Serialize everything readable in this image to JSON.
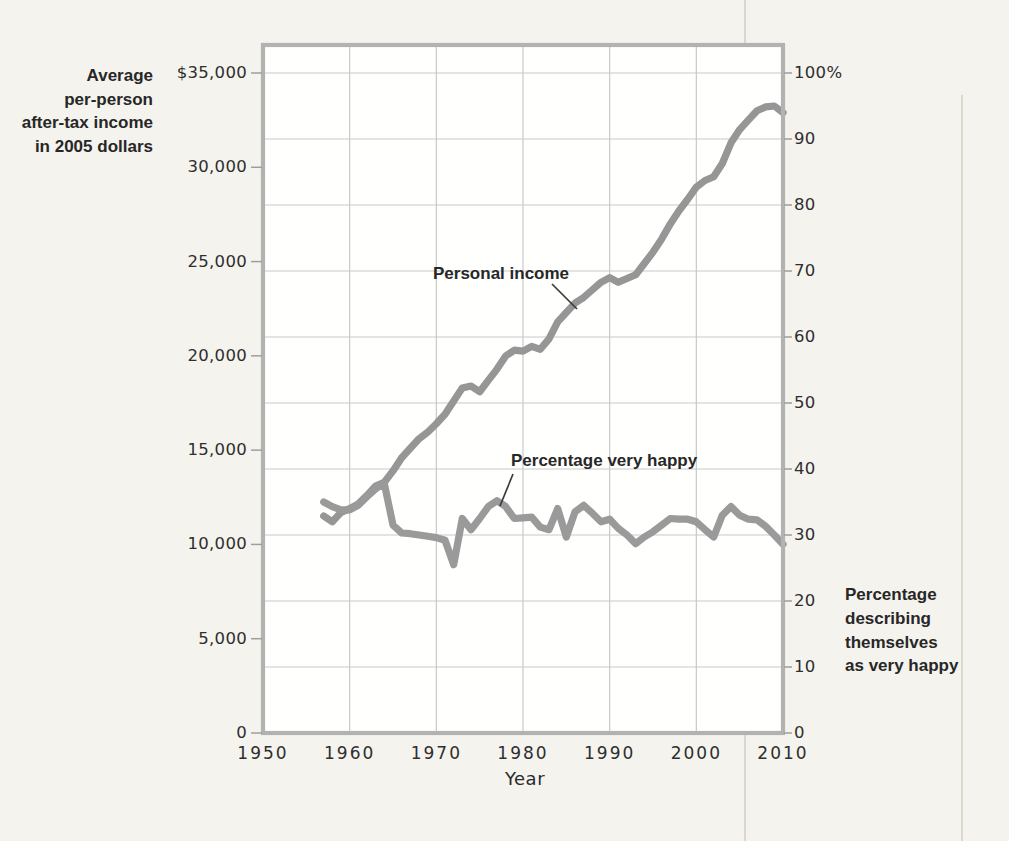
{
  "chart_data": {
    "type": "line",
    "title": "",
    "x_axis": {
      "label": "Year",
      "tick_labels": [
        "1950",
        "1960",
        "1970",
        "1980",
        "1990",
        "2000",
        "2010"
      ],
      "tick_values": [
        1950,
        1960,
        1970,
        1980,
        1990,
        2000,
        2010
      ],
      "range": [
        1950,
        2010
      ]
    },
    "y_left": {
      "title_lines": [
        "Average",
        "per-person",
        "after-tax income",
        "in 2005 dollars"
      ],
      "tick_labels": [
        "$35,000",
        "30,000",
        "25,000",
        "20,000",
        "15,000",
        "10,000",
        "5,000",
        "0"
      ],
      "tick_values": [
        35000,
        30000,
        25000,
        20000,
        15000,
        10000,
        5000,
        0
      ],
      "range": [
        0,
        35000
      ]
    },
    "y_right": {
      "title_lines": [
        "Percentage",
        "describing",
        "themselves",
        "as very happy"
      ],
      "tick_labels": [
        "100%",
        "90",
        "80",
        "70",
        "60",
        "50",
        "40",
        "30",
        "20",
        "10",
        "0"
      ],
      "tick_values": [
        100,
        90,
        80,
        70,
        60,
        50,
        40,
        30,
        20,
        10,
        0
      ],
      "range": [
        0,
        100
      ]
    },
    "grid": {
      "visible": true,
      "color": "#c9c9c9"
    },
    "legend_position": "inline-annotations",
    "series": [
      {
        "name": "Personal income",
        "axis": "left",
        "color": "#969696",
        "x": [
          1957,
          1958,
          1959,
          1960,
          1961,
          1962,
          1963,
          1964,
          1965,
          1966,
          1967,
          1968,
          1969,
          1970,
          1971,
          1972,
          1973,
          1974,
          1975,
          1976,
          1977,
          1978,
          1979,
          1980,
          1981,
          1982,
          1983,
          1984,
          1985,
          1986,
          1987,
          1988,
          1989,
          1990,
          1991,
          1992,
          1993,
          1994,
          1995,
          1996,
          1997,
          1998,
          1999,
          2000,
          2001,
          2002,
          2003,
          2004,
          2005,
          2006,
          2007,
          2008,
          2009,
          2010
        ],
        "values": [
          11500,
          11200,
          11700,
          11900,
          12150,
          12600,
          13100,
          13300,
          13900,
          14600,
          15100,
          15600,
          15950,
          16400,
          16900,
          17600,
          18300,
          18400,
          18100,
          18700,
          19300,
          20000,
          20300,
          20250,
          20500,
          20350,
          20900,
          21800,
          22300,
          22800,
          23100,
          23500,
          23900,
          24150,
          23900,
          24100,
          24300,
          24900,
          25500,
          26200,
          27000,
          27700,
          28300,
          28950,
          29300,
          29500,
          30200,
          31300,
          32000,
          32500,
          33000,
          33200,
          33250,
          32900
        ]
      },
      {
        "name": "Percentage very happy",
        "axis": "right",
        "color": "#9a9a9a",
        "x": [
          1957,
          1958,
          1959,
          1960,
          1961,
          1962,
          1963,
          1964,
          1965,
          1966,
          1967,
          1968,
          1969,
          1970,
          1971,
          1972,
          1973,
          1974,
          1975,
          1976,
          1977,
          1978,
          1979,
          1980,
          1981,
          1982,
          1983,
          1984,
          1985,
          1986,
          1987,
          1988,
          1989,
          1990,
          1991,
          1992,
          1993,
          1994,
          1995,
          1996,
          1997,
          1998,
          1999,
          2000,
          2001,
          2002,
          2003,
          2004,
          2005,
          2006,
          2007,
          2008,
          2009,
          2010
        ],
        "values": [
          35.0,
          34.3,
          33.8,
          33.8,
          34.5,
          35.8,
          37.0,
          37.8,
          31.5,
          30.3,
          30.2,
          30.0,
          29.8,
          29.6,
          29.2,
          25.5,
          32.5,
          30.8,
          32.5,
          34.3,
          35.2,
          34.3,
          32.5,
          32.6,
          32.7,
          31.2,
          30.8,
          34.0,
          29.7,
          33.5,
          34.5,
          33.3,
          32.0,
          32.4,
          31.0,
          30.0,
          28.7,
          29.7,
          30.5,
          31.5,
          32.5,
          32.4,
          32.4,
          32.0,
          30.8,
          29.7,
          33.0,
          34.3,
          33.0,
          32.4,
          32.3,
          31.3,
          30.0,
          28.6
        ]
      }
    ],
    "colors": {
      "page_background": "#f5f3ee",
      "plot_background": "#fffffe",
      "frame": "#b2b2b2",
      "grid": "#c9c9c9",
      "series_gray": "#989898",
      "text": "#2e2e2e"
    }
  }
}
